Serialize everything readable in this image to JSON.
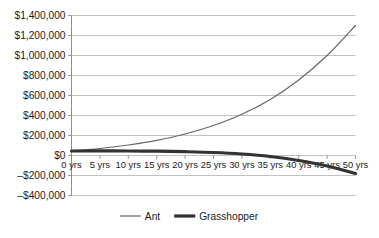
{
  "chart_data": {
    "type": "line",
    "title": "",
    "subtitle": "",
    "xlabel": "",
    "ylabel": "",
    "grid": "horizontal",
    "legend_position": "bottom",
    "background_color": "#ffffff",
    "grid_color": "#b3b3b3",
    "axis_color": "#808080",
    "text_color": "#1a1a1a",
    "x": [
      0,
      5,
      10,
      15,
      20,
      25,
      30,
      35,
      40,
      45,
      50
    ],
    "categories": [
      "0 yrs",
      "5 yrs",
      "10 yrs",
      "15 yrs",
      "20 yrs",
      "25 yrs",
      "30 yrs",
      "35 yrs",
      "40 yrs",
      "45 yrs",
      "50 yrs"
    ],
    "ylim": [
      -400000,
      1400000
    ],
    "yticks": [
      1400000,
      1200000,
      1000000,
      800000,
      600000,
      400000,
      200000,
      0,
      -200000,
      -400000
    ],
    "ytick_labels": [
      "$1,400,000",
      "$1,200,000",
      "$1,000,000",
      "$800,000",
      "$600,000",
      "$400,000",
      "$200,000",
      "$0",
      "–$200,000",
      "–$400,000"
    ],
    "series": [
      {
        "name": "Ant",
        "color": "#666666",
        "width": 1.2,
        "values": [
          45000,
          70000,
          105000,
          152000,
          215000,
          300000,
          412000,
          560000,
          755000,
          1000000,
          1300000
        ]
      },
      {
        "name": "Grasshopper",
        "color": "#333333",
        "width": 3.2,
        "values": [
          45000,
          46000,
          45000,
          43000,
          38000,
          30000,
          15000,
          -10000,
          -50000,
          -105000,
          -180000
        ]
      }
    ]
  },
  "legend": {
    "items": [
      {
        "label": "Ant",
        "color": "#666666",
        "width": 1.2
      },
      {
        "label": "Grasshopper",
        "color": "#333333",
        "width": 3.2
      }
    ]
  }
}
